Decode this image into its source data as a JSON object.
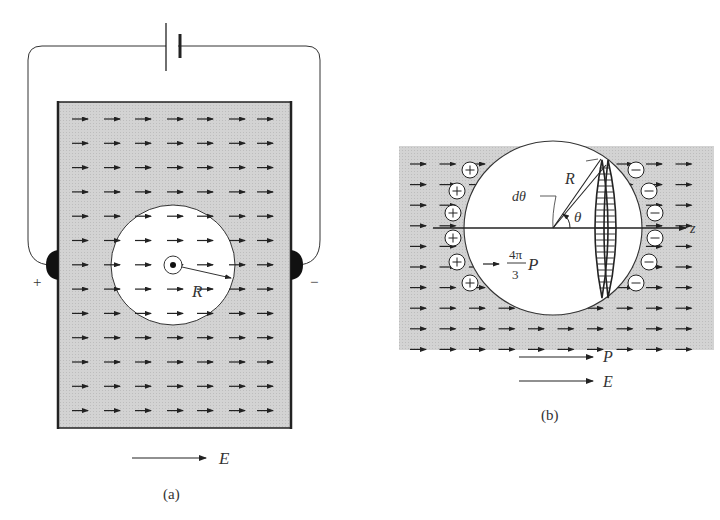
{
  "figure": {
    "panel_a": {
      "caption": "(a)",
      "plus_terminal": "+",
      "minus_terminal": "−",
      "radius_label": "R",
      "field_label": "E",
      "arrow_grid": {
        "columns": 7,
        "rows": 13
      },
      "center_symbol": "out-of-page dot"
    },
    "panel_b": {
      "caption": "(b)",
      "radius_label": "R",
      "dtheta_label": "dθ",
      "theta_label": "θ",
      "axis_label": "z",
      "inner_field_numerator": "4π",
      "inner_field_denominator": "3",
      "inner_field_symbol": "P",
      "legend_P": "P",
      "legend_E": "E",
      "plus_charge": "+",
      "minus_charge": "−",
      "charge_count_each_side": 7,
      "arrow_grid": {
        "columns": 10,
        "rows": 10
      }
    },
    "colors": {
      "dielectric": "#cfcfcf",
      "line": "#222222",
      "cavity": "#ffffff"
    }
  }
}
